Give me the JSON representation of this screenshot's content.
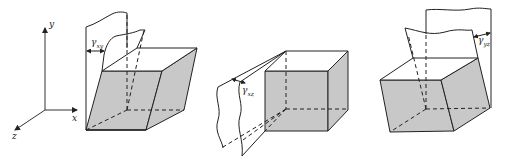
{
  "diagram": {
    "axes": {
      "x_label": "x",
      "y_label": "y",
      "z_label": "z"
    },
    "figures": [
      {
        "id": "xy",
        "symbol": "γ",
        "subscript": "xy",
        "shear_plane": "xy"
      },
      {
        "id": "xz",
        "symbol": "γ",
        "subscript": "xz",
        "shear_plane": "xz"
      },
      {
        "id": "yz",
        "symbol": "γ",
        "subscript": "yz",
        "shear_plane": "yz"
      }
    ],
    "colors": {
      "fill": "#c8c8c8",
      "stroke": "#222222",
      "background": "#ffffff"
    }
  }
}
